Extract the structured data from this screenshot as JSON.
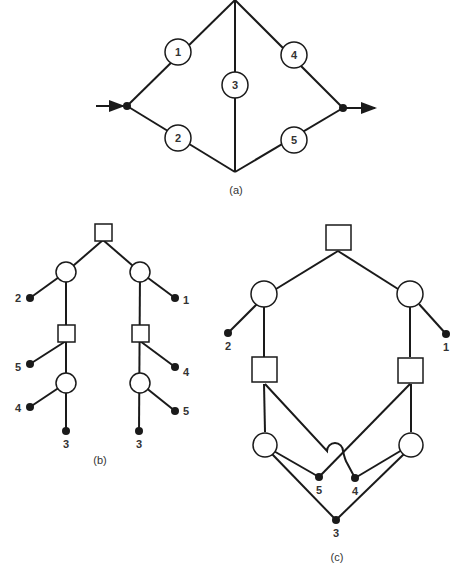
{
  "figure": {
    "panel_a": {
      "caption": "(a)",
      "components": [
        "1",
        "2",
        "3",
        "4",
        "5"
      ],
      "edges": [
        [
          "in",
          "1"
        ],
        [
          "1",
          "top"
        ],
        [
          "in",
          "2"
        ],
        [
          "2",
          "bottom"
        ],
        [
          "top",
          "3"
        ],
        [
          "3",
          "bottom"
        ],
        [
          "top",
          "4"
        ],
        [
          "4",
          "out"
        ],
        [
          "bottom",
          "5"
        ],
        [
          "5",
          "out"
        ]
      ]
    },
    "panel_b": {
      "caption": "(b)",
      "left_branch_labels": [
        "2",
        "5",
        "4",
        "3"
      ],
      "right_branch_labels": [
        "1",
        "4",
        "5",
        "3"
      ]
    },
    "panel_c": {
      "caption": "(c)",
      "leaf_labels": [
        "2",
        "1",
        "5",
        "4",
        "3"
      ]
    }
  }
}
